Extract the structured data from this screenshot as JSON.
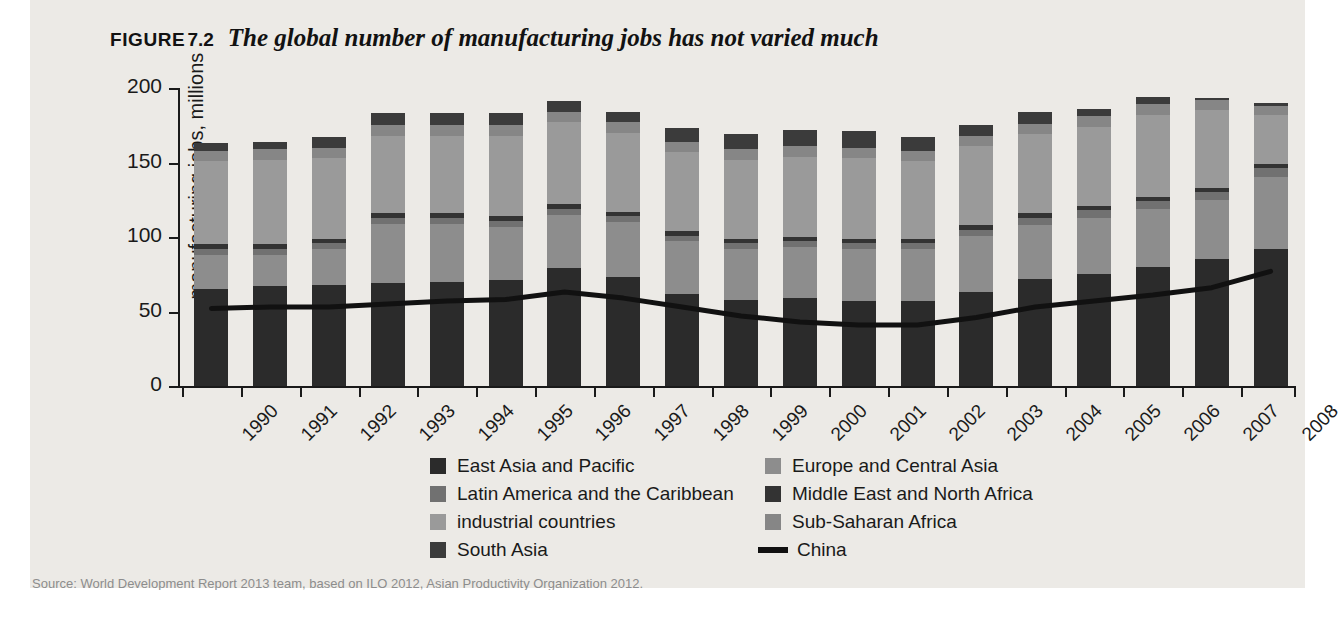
{
  "figure": {
    "label": "FIGURE",
    "number": "7.2",
    "title": "The global number of manufacturing jobs has not varied much"
  },
  "source": {
    "text": "Source: World Development Report 2013 team, based on ILO 2012, Asian Productivity Organization 2012."
  },
  "legend": {
    "items": [
      {
        "label": "East Asia and Pacific",
        "color": "#2b2b2b",
        "type": "swatch"
      },
      {
        "label": "Europe and Central Asia",
        "color": "#8d8d8d",
        "type": "swatch"
      },
      {
        "label": "Latin America and the Caribbean",
        "color": "#717171",
        "type": "swatch"
      },
      {
        "label": "Middle East and North Africa",
        "color": "#333333",
        "type": "swatch"
      },
      {
        "label": "industrial countries",
        "color": "#9a9a9a",
        "type": "swatch"
      },
      {
        "label": "Sub-Saharan Africa",
        "color": "#868686",
        "type": "swatch"
      },
      {
        "label": "South Asia",
        "color": "#3b3b3b",
        "type": "swatch"
      },
      {
        "label": "China",
        "color": "#111111",
        "type": "line"
      }
    ]
  },
  "chart_data": {
    "type": "bar",
    "stacked": true,
    "title": "The global number of manufacturing jobs has not varied much",
    "xlabel": "",
    "ylabel": "manufacturing jobs, millions",
    "ylim": [
      0,
      200
    ],
    "yticks": [
      0,
      50,
      100,
      150,
      200
    ],
    "grid": false,
    "legend_position": "bottom",
    "categories": [
      "1990",
      "1991",
      "1992",
      "1993",
      "1994",
      "1995",
      "1996",
      "1997",
      "1998",
      "1999",
      "2000",
      "2001",
      "2002",
      "2003",
      "2004",
      "2005",
      "2006",
      "2007",
      "2008"
    ],
    "series": [
      {
        "name": "East Asia and Pacific",
        "color": "#2b2b2b",
        "values": [
          65,
          67,
          68,
          69,
          70,
          71,
          79,
          73,
          62,
          58,
          59,
          57,
          57,
          63,
          72,
          75,
          80,
          85,
          92
        ]
      },
      {
        "name": "Europe and Central Asia",
        "color": "#8d8d8d",
        "values": [
          23,
          21,
          24,
          40,
          39,
          36,
          36,
          37,
          35,
          34,
          34,
          35,
          35,
          38,
          36,
          38,
          39,
          40,
          48
        ]
      },
      {
        "name": "Latin America and the Caribbean",
        "color": "#717171",
        "values": [
          4,
          4,
          4,
          4,
          4,
          4,
          4,
          4,
          4,
          4,
          4,
          4,
          4,
          4,
          5,
          5,
          5,
          5,
          6
        ]
      },
      {
        "name": "Middle East and North Africa",
        "color": "#333333",
        "values": [
          3,
          3,
          3,
          3,
          3,
          3,
          3,
          3,
          3,
          3,
          3,
          3,
          3,
          3,
          3,
          3,
          3,
          3,
          3
        ]
      },
      {
        "name": "industrial countries",
        "color": "#9a9a9a",
        "values": [
          56,
          57,
          54,
          52,
          52,
          54,
          55,
          53,
          53,
          53,
          54,
          54,
          52,
          53,
          53,
          53,
          55,
          52,
          33
        ]
      },
      {
        "name": "Sub-Saharan Africa",
        "color": "#868686",
        "values": [
          7,
          7,
          7,
          7,
          7,
          7,
          7,
          7,
          7,
          7,
          7,
          7,
          7,
          7,
          7,
          7,
          7,
          7,
          6
        ]
      },
      {
        "name": "South Asia",
        "color": "#3b3b3b",
        "values": [
          5,
          5,
          7,
          8,
          8,
          8,
          7,
          7,
          9,
          10,
          11,
          11,
          9,
          7,
          8,
          5,
          5,
          1,
          2
        ]
      }
    ],
    "totals": [
      163,
      164,
      167,
      183,
      183,
      183,
      191,
      184,
      173,
      169,
      172,
      171,
      167,
      175,
      184,
      186,
      194,
      193,
      190
    ],
    "line_series": {
      "name": "China",
      "color": "#111111",
      "values": [
        52,
        53,
        53,
        55,
        57,
        58,
        63,
        59,
        53,
        47,
        43,
        41,
        41,
        46,
        53,
        57,
        61,
        66,
        77
      ]
    }
  }
}
